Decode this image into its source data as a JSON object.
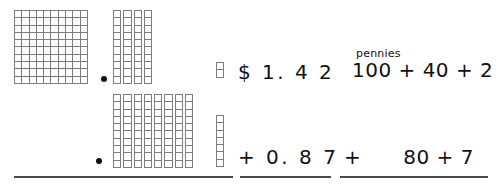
{
  "worksheet": {
    "title": "Base-ten blocks addition: $1.42 + $0.87",
    "pennies_label": "pennies",
    "money_top": "$ 1. 4 2",
    "money_bottom": "+ 0. 8 7",
    "expanded_top": "100 + 40 + 2",
    "expanded_bottom_operator": "+",
    "expanded_bottom_terms": "80 + 7",
    "decimal_point_top": "•",
    "decimal_point_bottom": "•"
  },
  "blocks": {
    "top_row": {
      "hundreds_flat": {
        "columns": 10,
        "rows": 10,
        "count": 1,
        "value": 100
      },
      "tens_rods": {
        "count": 4,
        "units_per_rod": 10,
        "value": 40
      },
      "ones_column": {
        "count": 2,
        "value": 2
      }
    },
    "bottom_row": {
      "hundreds_flat": {
        "count": 0,
        "value": 0
      },
      "tens_rods": {
        "count": 8,
        "units_per_rod": 10,
        "value": 80
      },
      "ones_column": {
        "count": 7,
        "value": 7
      }
    }
  },
  "colors": {
    "grid_line": "#7d7d7d",
    "rule_line": "#4a4a4a",
    "ink": "#111111",
    "background": "#ffffff"
  }
}
